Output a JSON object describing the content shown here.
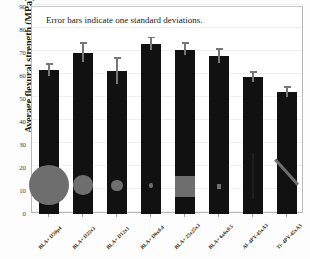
{
  "chart_data": {
    "type": "bar",
    "title": "",
    "annotation": "Error bars indicate one standard deviations.",
    "xlabel": "",
    "ylabel": "Average flexural strength (MPa)",
    "ylim": [
      0,
      90
    ],
    "ytick_step": 10,
    "yticks": [
      "0",
      "10",
      "20",
      "30",
      "40",
      "50",
      "60",
      "70",
      "80",
      "90"
    ],
    "grid": true,
    "legend": "none",
    "bar_color": "#111111",
    "error_color": "#777777",
    "overlay_color": "#6e6e6e",
    "categories": [
      "BLA+ D50µ4",
      "BLA+ D25x3",
      "BLA+ D12x1",
      "BLA+ D6x0.4",
      "BLA+ 25x25x3",
      "BLA+ 6x6x0.5",
      "Al- 4PY-45xA3",
      "Ti- 4PY-45xA3"
    ],
    "values": [
      62.5,
      70.0,
      62.0,
      74.0,
      71.5,
      68.5,
      59.5,
      53.0
    ],
    "errors": [
      2.5,
      4.0,
      5.5,
      2.5,
      2.5,
      3.0,
      2.0,
      2.0
    ],
    "overlays": [
      {
        "shape": "circle",
        "size_mpa": 17.5,
        "center_mpa": 12.5
      },
      {
        "shape": "circle",
        "size_mpa": 8.5,
        "center_mpa": 12.5
      },
      {
        "shape": "circle",
        "size_mpa": 5.0,
        "center_mpa": 12.5
      },
      {
        "shape": "circle",
        "size_mpa": 2.0,
        "center_mpa": 12.5
      },
      {
        "shape": "square",
        "size_mpa": 9.0,
        "center_mpa": 12.0
      },
      {
        "shape": "square",
        "size_mpa": 2.0,
        "center_mpa": 12.0
      },
      {
        "shape": "bar-vertical",
        "size_mpa": 9.0,
        "center_mpa": 16.5
      },
      {
        "shape": "bar-diagonal",
        "size_mpa": 7.0,
        "center_mpa": 18.5
      }
    ]
  }
}
